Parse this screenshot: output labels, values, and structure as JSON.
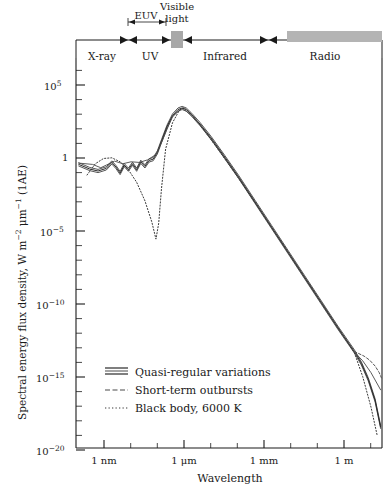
{
  "chart_data": {
    "type": "line",
    "title": "",
    "xlabel": "Wavelength",
    "ylabel": "Spectral energy flux density, W m⁻² μm⁻¹ (1AE)",
    "xscale": "log",
    "yscale": "log",
    "xlim_label": [
      "1 nm",
      "1 m"
    ],
    "x_tick_labels": [
      "1 nm",
      "1 μm",
      "1 mm",
      "1 m"
    ],
    "x_tick_decades": [
      -9,
      -6,
      -3,
      0
    ],
    "x_axis_range_decades": [
      -10.1,
      1.0
    ],
    "y_tick_labels": [
      "10⁵",
      "1",
      "10⁻⁵",
      "10⁻¹⁰",
      "10⁻¹⁵",
      "10⁻²⁰"
    ],
    "y_tick_exponents": [
      5,
      0,
      -5,
      -10,
      -15,
      -20
    ],
    "y_axis_range_exponents": [
      -22.0,
      7.5
    ],
    "grid": false,
    "legend_position": "lower-left-inside",
    "series": [
      {
        "name": "Quasi-regular variations",
        "style": "solid-band",
        "color": "#2b2b2b",
        "points": [
          [
            -10.0,
            -0.55
          ],
          [
            -9.6,
            -0.9
          ],
          [
            -9.3,
            -1.05
          ],
          [
            -9.0,
            -0.85
          ],
          [
            -8.8,
            -0.4
          ],
          [
            -8.65,
            -0.75
          ],
          [
            -8.5,
            -1.2
          ],
          [
            -8.35,
            -0.6
          ],
          [
            -8.2,
            -0.95
          ],
          [
            -8.05,
            -0.5
          ],
          [
            -7.9,
            -0.95
          ],
          [
            -7.75,
            -0.35
          ],
          [
            -7.6,
            -0.7
          ],
          [
            -7.45,
            -0.25
          ],
          [
            -7.3,
            -0.15
          ],
          [
            -7.15,
            0.35
          ],
          [
            -7.0,
            1.2
          ],
          [
            -6.8,
            2.3
          ],
          [
            -6.6,
            3.15
          ],
          [
            -6.4,
            3.6
          ],
          [
            -6.25,
            3.72
          ],
          [
            -6.1,
            3.6
          ],
          [
            -5.9,
            3.2
          ],
          [
            -5.6,
            2.5
          ],
          [
            -5.2,
            1.45
          ],
          [
            -4.7,
            0.0
          ],
          [
            -4.2,
            -1.5
          ],
          [
            -3.6,
            -3.4
          ],
          [
            -3.0,
            -5.3
          ],
          [
            -2.4,
            -7.2
          ],
          [
            -1.8,
            -9.1
          ],
          [
            -1.2,
            -11.0
          ],
          [
            -0.6,
            -12.9
          ],
          [
            -0.2,
            -14.1
          ],
          [
            0.0,
            -14.7
          ],
          [
            0.25,
            -15.6
          ],
          [
            0.5,
            -16.8
          ],
          [
            0.75,
            -18.4
          ],
          [
            0.95,
            -20.4
          ]
        ]
      },
      {
        "name": "Short-term outbursts",
        "style": "solid-upper",
        "color": "#4a4a4a",
        "points": [
          [
            -10.0,
            -0.45
          ],
          [
            -9.5,
            -0.55
          ],
          [
            -9.2,
            -0.8
          ],
          [
            -9.0,
            -0.6
          ],
          [
            -8.7,
            -0.3
          ],
          [
            -8.4,
            -0.5
          ],
          [
            -8.1,
            -0.35
          ],
          [
            -7.8,
            -0.4
          ],
          [
            -7.5,
            -0.2
          ],
          [
            -7.2,
            0.2
          ],
          [
            -7.0,
            1.1
          ],
          [
            -6.6,
            3.1
          ],
          [
            -6.25,
            3.7
          ],
          [
            -5.9,
            3.18
          ],
          [
            -5.2,
            1.4
          ],
          [
            -4.2,
            -1.55
          ],
          [
            -3.0,
            -5.35
          ],
          [
            -1.8,
            -9.15
          ],
          [
            -0.6,
            -12.95
          ],
          [
            0.0,
            -14.75
          ],
          [
            0.3,
            -15.4
          ],
          [
            0.6,
            -16.3
          ],
          [
            0.95,
            -17.6
          ]
        ]
      },
      {
        "name": "Black body, 6000 K",
        "style": "dotted",
        "color": "#3a3a3a",
        "points": [
          [
            -9.7,
            -1.35
          ],
          [
            -9.4,
            -0.5
          ],
          [
            -9.1,
            -0.1
          ],
          [
            -8.8,
            -0.05
          ],
          [
            -8.5,
            -0.35
          ],
          [
            -8.2,
            -0.95
          ],
          [
            -7.9,
            -1.9
          ],
          [
            -7.6,
            -3.3
          ],
          [
            -7.35,
            -4.9
          ],
          [
            -7.2,
            -6.2
          ],
          [
            -7.1,
            -5.0
          ],
          [
            -7.0,
            -2.4
          ],
          [
            -6.85,
            0.6
          ],
          [
            -6.6,
            2.6
          ],
          [
            -6.35,
            3.55
          ],
          [
            -6.2,
            3.74
          ],
          [
            -6.0,
            3.45
          ],
          [
            -5.6,
            2.45
          ],
          [
            -5.0,
            0.75
          ],
          [
            -4.2,
            -1.6
          ],
          [
            -3.2,
            -4.7
          ],
          [
            -2.2,
            -7.85
          ],
          [
            -1.2,
            -11.0
          ],
          [
            -0.5,
            -13.2
          ],
          [
            0.0,
            -14.8
          ],
          [
            0.3,
            -16.6
          ],
          [
            0.6,
            -18.9
          ],
          [
            0.82,
            -21.0
          ]
        ]
      },
      {
        "name": "Radio excess branch",
        "style": "dashed",
        "color": "#555555",
        "points": [
          [
            0.0,
            -14.7
          ],
          [
            0.15,
            -14.85
          ],
          [
            0.35,
            -15.05
          ],
          [
            0.55,
            -15.35
          ],
          [
            0.75,
            -15.8
          ],
          [
            0.9,
            -16.3
          ],
          [
            0.98,
            -16.7
          ]
        ]
      }
    ],
    "annotations": {
      "bands": [
        {
          "name": "X-ray",
          "label": "X-ray",
          "start_px": 76,
          "end_px": 128
        },
        {
          "name": "UV",
          "label": "UV",
          "start_px": 128,
          "end_px": 172
        },
        {
          "name": "Infrared",
          "label": "Infrared",
          "start_px": 182,
          "end_px": 268
        },
        {
          "name": "Radio",
          "label": "Radio",
          "start_px": 268,
          "end_px": 382
        }
      ],
      "sub_bands": [
        {
          "name": "EUV",
          "label": "EUV",
          "start_px": 128,
          "end_px": 166
        },
        {
          "name": "visible-light",
          "label": "Visible\nlight",
          "line1": "Visible",
          "line2": "light",
          "start_px": 172,
          "end_px": 182,
          "swatch_color": "#a8a8a8"
        }
      ],
      "radio_swatch": {
        "start_px": 287,
        "end_px": 382,
        "color": "#b4b4b4"
      }
    }
  },
  "legend": {
    "items": [
      {
        "label": "Quasi-regular variations",
        "swatch": "band-swatch"
      },
      {
        "label": "Short-term outbursts",
        "swatch": "dashed-swatch"
      },
      {
        "label": "Black body, 6000 K",
        "swatch": "dotted-swatch"
      }
    ]
  },
  "axes": {
    "x_label": "Wavelength",
    "y_label_html": "Spectral energy flux density, W m⁻² μm⁻¹ (1AE)",
    "y_label_parts": {
      "a": "Spectral energy flux density, W m",
      "exp1": "−2",
      "b": " μm",
      "exp2": "−1",
      "c": " (1AE)"
    },
    "x_ticks": [
      {
        "label": "1 nm",
        "decade": -9
      },
      {
        "label": "1 μm",
        "decade": -6
      },
      {
        "label": "1 mm",
        "decade": -3
      },
      {
        "label": "1 m",
        "decade": 0
      }
    ],
    "y_ticks": [
      {
        "base": "10",
        "exp": "5",
        "display": "10⁵"
      },
      {
        "base": "1",
        "exp": "",
        "display": "1"
      },
      {
        "base": "10",
        "exp": "−5",
        "display": "10⁻⁵"
      },
      {
        "base": "10",
        "exp": "−10",
        "display": "10⁻¹⁰"
      },
      {
        "base": "10",
        "exp": "−15",
        "display": "10⁻¹⁵"
      },
      {
        "base": "10",
        "exp": "−20",
        "display": "10⁻²⁰"
      }
    ]
  },
  "bands": {
    "xray": "X-ray",
    "uv": "UV",
    "euv": "EUV",
    "visible_line1": "Visible",
    "visible_line2": "light",
    "infrared": "Infrared",
    "radio": "Radio"
  },
  "colors": {
    "axis": "#1a1a1a",
    "curve_main": "#2b2b2b",
    "curve_secondary": "#4a4a4a",
    "curve_blackbody": "#3a3a3a",
    "swatch_gray": "#b4b4b4",
    "visible_swatch": "#a8a8a8",
    "background": "#ffffff"
  }
}
